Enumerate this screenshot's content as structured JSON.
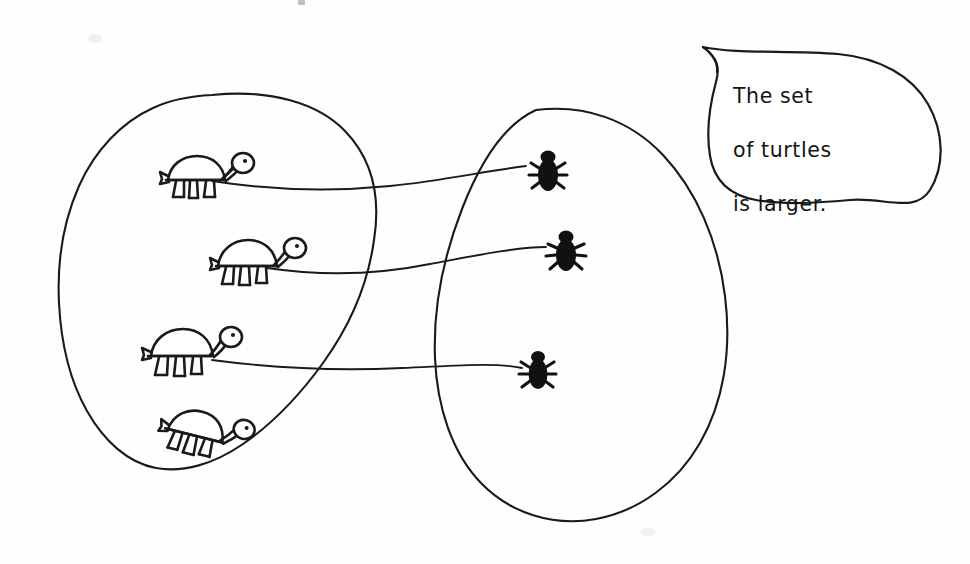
{
  "figure": {
    "type": "set-correspondence-diagram",
    "caption_bubble": {
      "speaker_claim": "The set of turtles is larger.",
      "lines": [
        "The set",
        "of turtles",
        "is larger."
      ]
    },
    "left_set": {
      "name": "turtles",
      "label": "set of turtles",
      "count": 4,
      "member_icon": "turtle-icon",
      "members": [
        {
          "id": "turtle-1",
          "x": 160,
          "y": 148,
          "rotation": 0,
          "matched": true
        },
        {
          "id": "turtle-2",
          "x": 210,
          "y": 232,
          "rotation": 0,
          "matched": true
        },
        {
          "id": "turtle-3",
          "x": 143,
          "y": 322,
          "rotation": 0,
          "matched": true
        },
        {
          "id": "turtle-4",
          "x": 168,
          "y": 396,
          "rotation": 14,
          "matched": false
        }
      ]
    },
    "right_set": {
      "name": "bugs",
      "label": "set of bugs",
      "count": 3,
      "member_icon": "bug-icon",
      "members": [
        {
          "id": "bug-1",
          "x": 530,
          "y": 150,
          "matched": true
        },
        {
          "id": "bug-2",
          "x": 548,
          "y": 230,
          "matched": true
        },
        {
          "id": "bug-3",
          "x": 521,
          "y": 350,
          "matched": true
        }
      ]
    },
    "correspondences": [
      {
        "id": "match-1",
        "from": "turtle-1",
        "to": "bug-1"
      },
      {
        "id": "match-2",
        "from": "turtle-2",
        "to": "bug-2"
      },
      {
        "id": "match-3",
        "from": "turtle-3",
        "to": "bug-3"
      }
    ],
    "unmatched": [
      "turtle-4"
    ],
    "colors": {
      "ink": "#1a1a1a",
      "bug_fill": "#111111",
      "paper": "#ffffff"
    }
  }
}
